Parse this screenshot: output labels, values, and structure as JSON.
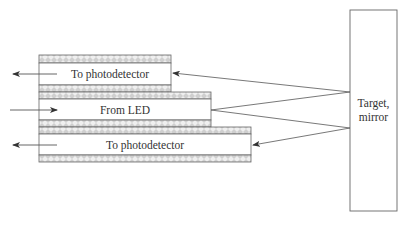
{
  "diagram": {
    "type": "fiber-optic reflective sensor",
    "fibers": [
      {
        "id": "top",
        "label": "To photodetector",
        "direction": "out"
      },
      {
        "id": "middle",
        "label": "From LED",
        "direction": "in"
      },
      {
        "id": "bottom",
        "label": "To photodetector",
        "direction": "out"
      }
    ],
    "target": {
      "label_line1": "Target,",
      "label_line2": "mirror"
    }
  },
  "colors": {
    "line": "#555555",
    "cladding_fill": "#d4d4d4",
    "cladding_hatch": "#f2f2f2",
    "background": "#ffffff"
  }
}
